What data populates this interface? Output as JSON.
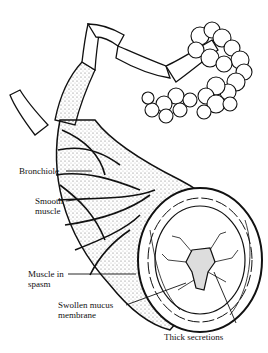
{
  "diagram": {
    "labels": {
      "bronchiole": "Bronchiole",
      "smooth_muscle_1": "Smooth",
      "smooth_muscle_2": "muscle",
      "muscle_spasm_1": "Muscle in",
      "muscle_spasm_2": "spasm",
      "swollen_1": "Swollen mucus",
      "swollen_2": "membrane",
      "thick_secretions": "Thick secretions"
    },
    "colors": {
      "ink": "#111111",
      "background": "#ffffff"
    }
  }
}
